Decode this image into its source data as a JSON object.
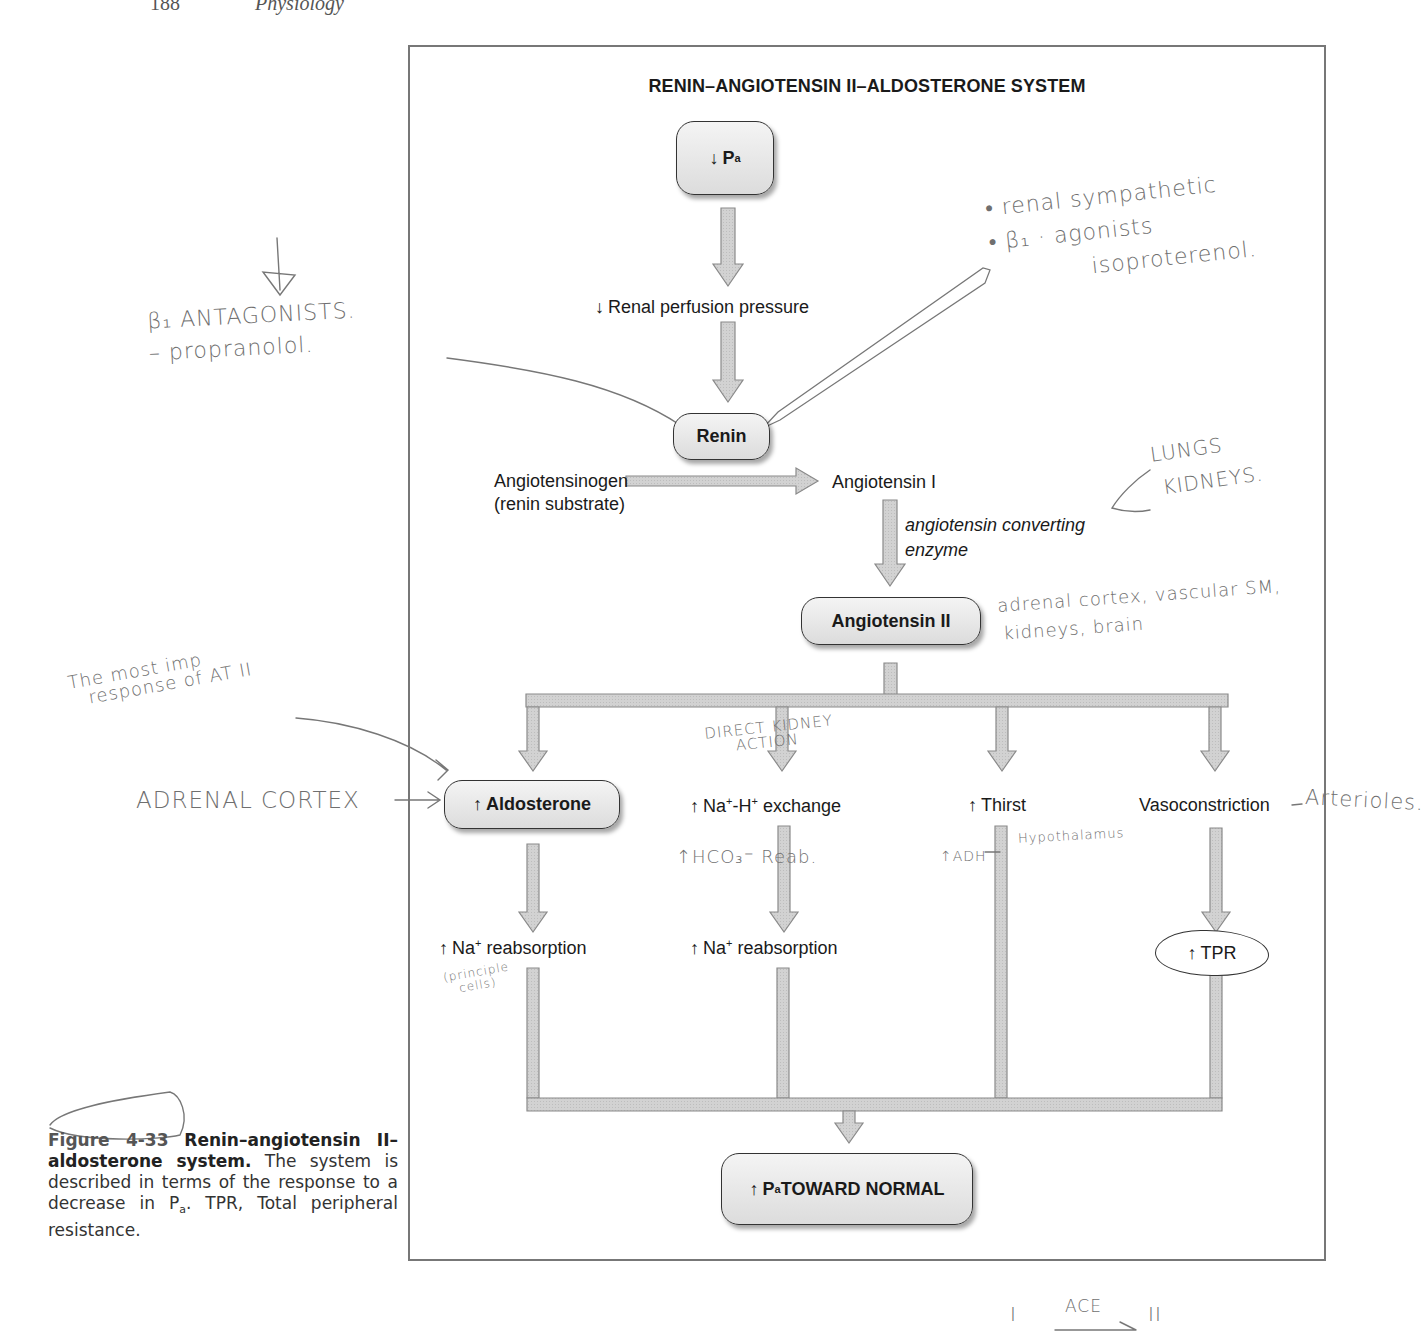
{
  "running_head": {
    "page": "188",
    "title": "Physiology"
  },
  "diagram": {
    "title": "RENIN–ANGIOTENSIN II–ALDOSTERONE SYSTEM",
    "nodes": {
      "pa_decrease": {
        "arrow": "↓",
        "label": "P",
        "sub": "a"
      },
      "renal_perfusion": {
        "arrow": "↓",
        "label": "Renal perfusion pressure"
      },
      "renin": {
        "label": "Renin"
      },
      "angiotensinogen": {
        "line1": "Angiotensinogen",
        "line2": "(renin substrate)"
      },
      "angiotensin_i": {
        "label": "Angiotensin I"
      },
      "ace": {
        "line1": "angiotensin converting",
        "line2": "enzyme"
      },
      "angiotensin_ii": {
        "label": "Angiotensin II"
      },
      "aldosterone": {
        "arrow": "↑",
        "label": "Aldosterone"
      },
      "na_h_exchange": {
        "arrow": "↑",
        "pre": "Na",
        "sup1": "+",
        "mid": "-H",
        "sup2": "+",
        "post": " exchange"
      },
      "thirst": {
        "arrow": "↑",
        "label": "Thirst"
      },
      "vasoconstriction": {
        "label": "Vasoconstriction"
      },
      "na_reabsorption_1": {
        "arrow": "↑",
        "pre": "Na",
        "sup": "+",
        "post": " reabsorption"
      },
      "na_reabsorption_2": {
        "arrow": "↑",
        "pre": "Na",
        "sup": "+",
        "post": " reabsorption"
      },
      "tpr": {
        "arrow": "↑",
        "label": "TPR"
      },
      "pa_normal": {
        "arrow": "↑",
        "label": "P",
        "sub": "a",
        "post": " TOWARD NORMAL"
      }
    },
    "colors": {
      "arrow_fill": "#cfcfcf",
      "arrow_stroke": "#8a8a8a",
      "node_fill": "#e6e6e6",
      "frame": "#777777",
      "handwriting": "#6f6f6f"
    }
  },
  "annotations": {
    "beta_antagonists": {
      "line1": "β₁ ANTAGONISTS.",
      "line2": "– propranolol."
    },
    "renal_sympathetic": {
      "line1": "• renal sympathetic",
      "line2": "• β₁ · agonists",
      "line3": "isoproterenol."
    },
    "lungs_kidneys": {
      "line1": "LUNGS",
      "line2": "KIDNEYS."
    },
    "at2_targets": {
      "line1": "adrenal cortex, vascular SM,",
      "line2": "kidneys, brain"
    },
    "most_imp": {
      "line1": "The most imp",
      "line2": "response of AT II"
    },
    "adrenal_cortex": {
      "label": "ADRENAL CORTEX"
    },
    "direct_kidney": {
      "line1": "DIRECT KIDNEY",
      "line2": "ACTION"
    },
    "hco3": {
      "label": "↑HCO₃⁻ Reab."
    },
    "adh": {
      "label": "↑ADH"
    },
    "hypothalamus": {
      "label": "Hypothalamus"
    },
    "arterioles": {
      "label": "Arterioles."
    },
    "principle_cells": {
      "line1": "(principle",
      "line2": "cells)"
    },
    "ace_note": {
      "left": "I",
      "over": "ACE",
      "right": "II"
    }
  },
  "caption": {
    "figure_label": "Figure 4-33",
    "bold_title": "Renin–angiotensin II–aldosterone system.",
    "text_before_sub": "The system is described in terms of the response to a decrease in P",
    "sub": "a",
    "text_after_sub": ". TPR, Total peripheral resistance."
  }
}
